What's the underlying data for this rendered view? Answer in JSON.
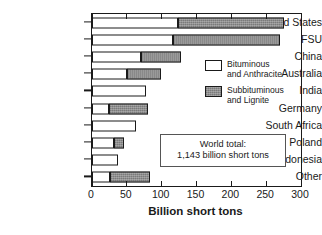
{
  "chart_data": {
    "type": "bar",
    "orientation": "horizontal",
    "stacked": true,
    "title": "",
    "xlabel": "Billion short tons",
    "ylabel": "",
    "xlim": [
      0,
      300
    ],
    "xticks": [
      0,
      50,
      100,
      150,
      200,
      250,
      300
    ],
    "xtick_labels": [
      "0",
      "50",
      "100",
      "150",
      "200",
      "250",
      "300"
    ],
    "grid": false,
    "legend_position": "upper right inside",
    "categories": [
      "United States",
      "FSU",
      "China",
      "Australia",
      "India",
      "Germany",
      "South Africa",
      "Poland",
      "Indonesia",
      "Other"
    ],
    "series": [
      {
        "name": "Bituminous and Anthracite",
        "color": "#ffffff",
        "values": [
          123,
          116,
          70,
          50,
          78,
          25,
          63,
          32,
          38,
          26
        ]
      },
      {
        "name": "Subbituminous and Lignite",
        "color": "#8e8e8e",
        "values": [
          152,
          154,
          58,
          49,
          0,
          55,
          0,
          14,
          0,
          57
        ]
      }
    ],
    "totals": [
      275,
      270,
      128,
      99,
      78,
      80,
      63,
      46,
      38,
      83
    ],
    "annotations": [
      {
        "name": "world-total",
        "line1": "World total:",
        "line2": "1,143 billion short tons"
      }
    ]
  },
  "legend": {
    "entries": [
      {
        "label_line1": "Bituminous",
        "label_line2": "and Anthracite",
        "swatch": "white"
      },
      {
        "label_line1": "Subbituminous",
        "label_line2": "and Lignite",
        "swatch": "gray"
      }
    ]
  },
  "annotation": {
    "line1": "World total:",
    "line2": "1,143 billion short tons"
  },
  "axis": {
    "xlabel": "Billion short tons"
  },
  "colors": {
    "bituminous": "#ffffff",
    "subbituminous": "#8e8e8e",
    "axis": "#1a1a1a",
    "background": "#ffffff"
  }
}
